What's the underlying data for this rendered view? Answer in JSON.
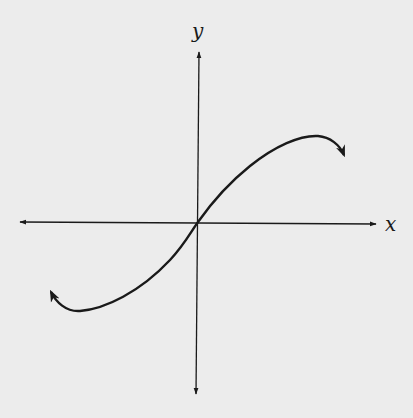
{
  "diagram": {
    "type": "function-graph",
    "axes": {
      "x_label": "x",
      "y_label": "y"
    },
    "colors": {
      "background": "#ececec",
      "ink": "#1a1a1a"
    },
    "curve": {
      "passes_through": "origin",
      "features": [
        "local minimum in quadrant III",
        "local maximum in quadrant I",
        "end arrows on both ends"
      ]
    }
  }
}
